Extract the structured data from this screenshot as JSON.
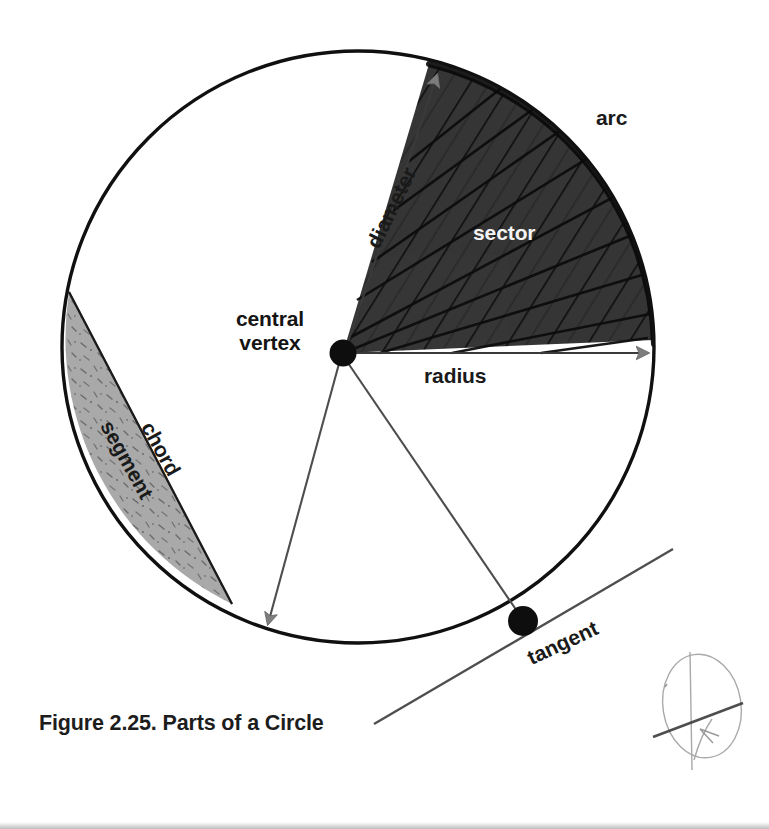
{
  "figure": {
    "caption": "Figure 2.25. Parts of a Circle",
    "title": "Parts of a Circle",
    "number": "2.25"
  },
  "labels": {
    "central_vertex_line1": "central",
    "central_vertex_line2": "vertex",
    "arc": "arc",
    "radius": "radius",
    "sector": "sector",
    "diameter": "diameter",
    "chord": "chord",
    "segment": "segment",
    "tangent": "tangent"
  },
  "colors": {
    "background": "#ffffff",
    "outline": "#111111",
    "sector_fill": "#3b3b3b",
    "sector_hatch": "#111111",
    "sector_label": "#f4f4f4",
    "segment_fill": "#a9a9a9",
    "segment_speckle": "#6e6e6e",
    "arrow_gray": "#808080",
    "thin_line": "#4d4d4d",
    "vertex_dot": "#111111",
    "caption_text": "#1d1d1d",
    "label_text": "#141414",
    "sketch_watermark": "#8c8c8c",
    "bottom_strip": "#bdbdbd"
  },
  "geometry": {
    "circle": {
      "cx": 358,
      "cy": 347,
      "r": 296
    },
    "central_vertex_dot": {
      "x": 343,
      "y": 353,
      "r": 13
    },
    "tangent_point_dot": {
      "x": 523,
      "y": 621,
      "r": 15
    },
    "sector_start_angle_deg": -76,
    "sector_end_angle_deg": 2,
    "sector_hatch_count": 9,
    "arc_tick_count": 26,
    "radius_endpoint": {
      "x": 653,
      "y": 353
    },
    "diameter_endpoint": {
      "x": 448,
      "y": 62
    },
    "chord_endpoints": [
      {
        "x": 70,
        "y": 295
      },
      {
        "x": 228,
        "y": 600
      }
    ],
    "thin_ray_endpoints": [
      {
        "x": 272,
        "y": 630
      },
      {
        "x": 523,
        "y": 621
      }
    ],
    "tangent_line": [
      {
        "x": 375,
        "y": 723
      },
      {
        "x": 672,
        "y": 550
      }
    ]
  },
  "elements": [
    {
      "name": "circle-outline",
      "kind": "shape"
    },
    {
      "name": "sector-region",
      "kind": "filled-hatched-region"
    },
    {
      "name": "segment-region",
      "kind": "filled-speckled-region"
    },
    {
      "name": "diameter-line",
      "kind": "line-with-arrowheads"
    },
    {
      "name": "radius-line",
      "kind": "line-with-arrowhead"
    },
    {
      "name": "chord-line",
      "kind": "line"
    },
    {
      "name": "tangent-line",
      "kind": "line"
    },
    {
      "name": "arc-highlight",
      "kind": "tick-decorated-arc"
    },
    {
      "name": "central-vertex-dot",
      "kind": "point-marker"
    },
    {
      "name": "tangent-point-dot",
      "kind": "point-marker"
    },
    {
      "name": "sketch-watermark",
      "kind": "scan-artifact"
    }
  ]
}
